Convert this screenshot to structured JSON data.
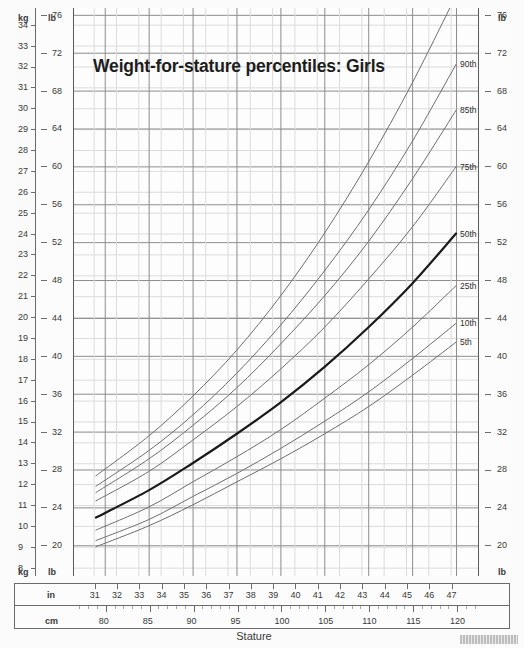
{
  "title": "Weight-for-stature percentiles: Girls",
  "axis_caption": "Stature",
  "units": {
    "kg": "kg",
    "lb": "lb",
    "in": "in",
    "cm": "cm"
  },
  "chart_data": {
    "type": "line",
    "title": "Weight-for-stature percentiles: Girls",
    "xlabel": "Stature",
    "ylabel": "Weight",
    "grid": true,
    "legend_position": "right-inline",
    "x_axis": {
      "primary_unit": "in",
      "primary_ticks": [
        31,
        32,
        33,
        34,
        35,
        36,
        37,
        38,
        39,
        40,
        41,
        42,
        43,
        44,
        45,
        46,
        47
      ],
      "primary_labels": [
        "31",
        "32",
        "33",
        "34",
        "35",
        "36",
        "37",
        "38",
        "39",
        "40",
        "41",
        "42",
        "43",
        "44",
        "45",
        "46",
        "47"
      ],
      "secondary_unit": "cm",
      "secondary_ticks": [
        80,
        85,
        90,
        95,
        100,
        105,
        110,
        115,
        120
      ],
      "secondary_labels": [
        "80",
        "85",
        "90",
        "95",
        "100",
        "105",
        "110",
        "115",
        "120"
      ],
      "xlim_cm": [
        76.5,
        122.5
      ]
    },
    "y_axis": {
      "primary_unit": "kg",
      "primary_ticks": [
        8,
        9,
        10,
        11,
        12,
        13,
        14,
        15,
        16,
        17,
        18,
        19,
        20,
        21,
        22,
        23,
        24,
        25,
        26,
        27,
        28,
        29,
        30,
        31,
        32,
        33,
        34
      ],
      "primary_labels": [
        "8",
        "9",
        "10",
        "11",
        "12",
        "13",
        "14",
        "15",
        "16",
        "17",
        "18",
        "19",
        "20",
        "21",
        "22",
        "23",
        "24",
        "25",
        "26",
        "27",
        "28",
        "29",
        "30",
        "31",
        "32",
        "33",
        "34"
      ],
      "secondary_unit": "lb",
      "secondary_ticks": [
        20,
        24,
        28,
        32,
        36,
        40,
        44,
        48,
        52,
        56,
        60,
        64,
        68,
        72,
        76
      ],
      "secondary_labels": [
        "20",
        "24",
        "28",
        "32",
        "36",
        "40",
        "44",
        "48",
        "52",
        "56",
        "60",
        "64",
        "68",
        "72",
        "76"
      ],
      "ylim_kg": [
        7.6,
        34.8
      ]
    },
    "series": [
      {
        "name": "95th",
        "label": "95th",
        "x_cm": [
          79,
          85,
          90,
          95,
          100,
          105,
          110,
          115,
          120
        ],
        "y_kg": [
          12.4,
          14.3,
          16.2,
          18.4,
          21.0,
          24.0,
          27.4,
          31.2,
          35.4
        ],
        "highlight": false
      },
      {
        "name": "90th",
        "label": "90th",
        "x_cm": [
          79,
          85,
          90,
          95,
          100,
          105,
          110,
          115,
          120
        ],
        "y_kg": [
          11.9,
          13.6,
          15.3,
          17.3,
          19.6,
          22.2,
          25.1,
          28.4,
          32.1
        ],
        "highlight": false
      },
      {
        "name": "85th",
        "label": "85th",
        "x_cm": [
          79,
          85,
          90,
          95,
          100,
          105,
          110,
          115,
          120
        ],
        "y_kg": [
          11.6,
          13.2,
          14.8,
          16.6,
          18.7,
          21.0,
          23.6,
          26.6,
          29.9
        ],
        "highlight": false
      },
      {
        "name": "75th",
        "label": "75th",
        "x_cm": [
          79,
          85,
          90,
          95,
          100,
          105,
          110,
          115,
          120
        ],
        "y_kg": [
          11.2,
          12.6,
          14.1,
          15.7,
          17.5,
          19.5,
          21.8,
          24.3,
          27.2
        ],
        "highlight": false
      },
      {
        "name": "50th",
        "label": "50th",
        "x_cm": [
          79,
          85,
          90,
          95,
          100,
          105,
          110,
          115,
          120
        ],
        "y_kg": [
          10.4,
          11.7,
          13.0,
          14.4,
          15.9,
          17.6,
          19.5,
          21.6,
          24.0
        ],
        "highlight": true
      },
      {
        "name": "25th",
        "label": "25th",
        "x_cm": [
          79,
          85,
          90,
          95,
          100,
          105,
          110,
          115,
          120
        ],
        "y_kg": [
          9.8,
          10.9,
          12.1,
          13.3,
          14.6,
          16.1,
          17.7,
          19.5,
          21.5
        ],
        "highlight": false
      },
      {
        "name": "10th",
        "label": "10th",
        "x_cm": [
          79,
          85,
          90,
          95,
          100,
          105,
          110,
          115,
          120
        ],
        "y_kg": [
          9.3,
          10.3,
          11.4,
          12.5,
          13.7,
          15.0,
          16.4,
          18.0,
          19.7
        ],
        "highlight": false
      },
      {
        "name": "5th",
        "label": "5th",
        "x_cm": [
          79,
          85,
          90,
          95,
          100,
          105,
          110,
          115,
          120
        ],
        "y_kg": [
          9.0,
          10.0,
          11.0,
          12.1,
          13.2,
          14.4,
          15.7,
          17.2,
          18.8
        ],
        "highlight": false
      }
    ],
    "colors": {
      "curve": "#6e6e6e",
      "curve_highlight": "#1a1a1a",
      "grid_major": "#8c8c8c",
      "grid_minor": "#dcdcdc",
      "frame": "#5a5a5a",
      "text": "#2b2b2b"
    }
  }
}
